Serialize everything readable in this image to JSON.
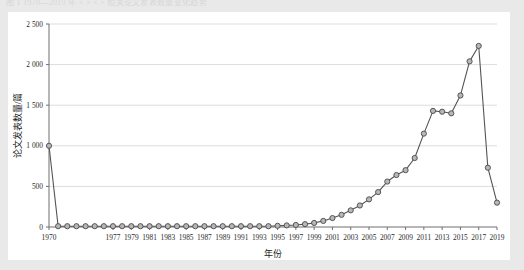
{
  "figure": {
    "top_caption": "图 1  1970—2019 年 × × × × 相关论文发表数量变化趋势"
  },
  "chart_data": {
    "type": "line",
    "title": "",
    "xlabel": "年份",
    "ylabel": "论文发表数量/篇",
    "xlim": [
      1970,
      2019
    ],
    "ylim": [
      0,
      2500
    ],
    "ytick_labels": [
      "0",
      "500",
      "1 000",
      "1 500",
      "2 000",
      "2 500"
    ],
    "ytick_values": [
      0,
      500,
      1000,
      1500,
      2000,
      2500
    ],
    "xtick_labels": [
      "1970",
      "1977",
      "1979",
      "1981",
      "1983",
      "1985",
      "1987",
      "1989",
      "1991",
      "1993",
      "1995",
      "1997",
      "1999",
      "2001",
      "2003",
      "2005",
      "2007",
      "2009",
      "2011",
      "2013",
      "2015",
      "2017",
      "2019"
    ],
    "xtick_values": [
      1970,
      1977,
      1979,
      1981,
      1983,
      1985,
      1987,
      1989,
      1991,
      1993,
      1995,
      1997,
      1999,
      2001,
      2003,
      2005,
      2007,
      2009,
      2011,
      2013,
      2015,
      2017,
      2019
    ],
    "grid": "horizontal",
    "legend": "none",
    "marker": "circle",
    "x": [
      1970,
      1971,
      1972,
      1973,
      1974,
      1975,
      1976,
      1977,
      1978,
      1979,
      1980,
      1981,
      1982,
      1983,
      1984,
      1985,
      1986,
      1987,
      1988,
      1989,
      1990,
      1991,
      1992,
      1993,
      1994,
      1995,
      1996,
      1997,
      1998,
      1999,
      2000,
      2001,
      2002,
      2003,
      2004,
      2005,
      2006,
      2007,
      2008,
      2009,
      2010,
      2011,
      2012,
      2013,
      2014,
      2015,
      2016,
      2017,
      2018,
      2019
    ],
    "values": [
      1000,
      10,
      10,
      10,
      10,
      10,
      10,
      10,
      10,
      10,
      10,
      10,
      10,
      10,
      10,
      10,
      10,
      10,
      10,
      10,
      10,
      10,
      10,
      10,
      10,
      15,
      20,
      25,
      35,
      50,
      75,
      110,
      150,
      205,
      265,
      340,
      430,
      560,
      640,
      700,
      850,
      1150,
      1430,
      1420,
      1400,
      1620,
      2040,
      2230,
      730,
      300
    ]
  }
}
